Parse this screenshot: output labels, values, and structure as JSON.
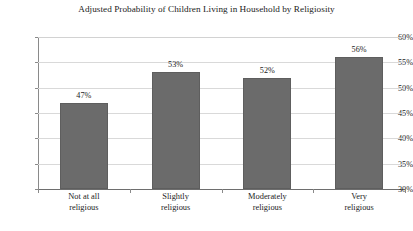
{
  "chart_data": {
    "type": "bar",
    "title": "Adjusted Probability of Children Living in Household by Religiosity",
    "xlabel": "",
    "ylabel": "",
    "categories": [
      "Not at all religious",
      "Slightly religious",
      "Moderately religious",
      "Very religious"
    ],
    "category_lines": [
      [
        "Not at all",
        "religious"
      ],
      [
        "Slightly",
        "religious"
      ],
      [
        "Moderately",
        "religious"
      ],
      [
        "Very",
        "religious"
      ]
    ],
    "values": [
      47,
      53,
      52,
      56
    ],
    "value_labels": [
      "47%",
      "53%",
      "52%",
      "56%"
    ],
    "ylim": [
      30,
      60
    ],
    "ytick_values": [
      30,
      35,
      40,
      45,
      50,
      55,
      60
    ],
    "ytick_labels": [
      "30%",
      "35%",
      "40%",
      "45%",
      "50%",
      "55%",
      "60%"
    ],
    "grid": true,
    "legend": null,
    "bar_color": "#6b6b6b",
    "gridline_color": "#d9d9d9",
    "axis_color": "#8a8a8a",
    "background_color": "#ffffff"
  },
  "footer": {
    "clipped_caption": ""
  }
}
